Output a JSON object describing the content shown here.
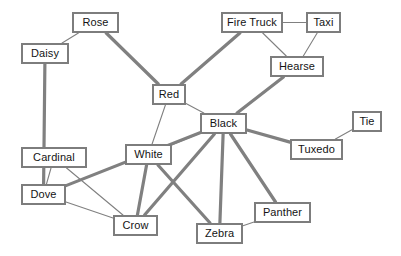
{
  "diagram": {
    "type": "node-link-graph",
    "background_color": "#ffffff",
    "node_border_color": "#7d7d7d",
    "node_fill_color": "#ffffff",
    "node_text_color": "#141414",
    "edge_color": "#808080",
    "edge_thick_width": 3.2,
    "edge_thin_width": 1.1,
    "nodes": [
      {
        "id": "rose",
        "label": "Rose",
        "x": 72,
        "y": 12,
        "w": 47,
        "h": 21
      },
      {
        "id": "fire_truck",
        "label": "Fire Truck",
        "x": 221,
        "y": 12,
        "w": 62,
        "h": 21
      },
      {
        "id": "taxi",
        "label": "Taxi",
        "x": 306,
        "y": 12,
        "w": 35,
        "h": 21
      },
      {
        "id": "daisy",
        "label": "Daisy",
        "x": 21,
        "y": 43,
        "w": 48,
        "h": 21
      },
      {
        "id": "hearse",
        "label": "Hearse",
        "x": 270,
        "y": 56,
        "w": 54,
        "h": 21
      },
      {
        "id": "red",
        "label": "Red",
        "x": 152,
        "y": 84,
        "w": 34,
        "h": 21
      },
      {
        "id": "black",
        "label": "Black",
        "x": 200,
        "y": 113,
        "w": 47,
        "h": 21
      },
      {
        "id": "tie",
        "label": "Tie",
        "x": 352,
        "y": 111,
        "w": 30,
        "h": 21
      },
      {
        "id": "white",
        "label": "White",
        "x": 125,
        "y": 144,
        "w": 47,
        "h": 21
      },
      {
        "id": "tuxedo",
        "label": "Tuxedo",
        "x": 290,
        "y": 139,
        "w": 53,
        "h": 21
      },
      {
        "id": "cardinal",
        "label": "Cardinal",
        "x": 21,
        "y": 147,
        "w": 66,
        "h": 21
      },
      {
        "id": "dove",
        "label": "Dove",
        "x": 21,
        "y": 184,
        "w": 45,
        "h": 21
      },
      {
        "id": "panther",
        "label": "Panther",
        "x": 254,
        "y": 202,
        "w": 57,
        "h": 21
      },
      {
        "id": "crow",
        "label": "Crow",
        "x": 113,
        "y": 215,
        "w": 45,
        "h": 21
      },
      {
        "id": "zebra",
        "label": "Zebra",
        "x": 196,
        "y": 223,
        "w": 47,
        "h": 21
      }
    ],
    "edges": [
      {
        "source": "daisy",
        "target": "rose",
        "weight": "thin"
      },
      {
        "source": "rose",
        "target": "red",
        "weight": "thick"
      },
      {
        "source": "daisy",
        "target": "dove",
        "weight": "thick"
      },
      {
        "source": "fire_truck",
        "target": "taxi",
        "weight": "thin"
      },
      {
        "source": "fire_truck",
        "target": "hearse",
        "weight": "thin"
      },
      {
        "source": "taxi",
        "target": "hearse",
        "weight": "thin"
      },
      {
        "source": "fire_truck",
        "target": "red",
        "weight": "thick"
      },
      {
        "source": "hearse",
        "target": "black",
        "weight": "thick"
      },
      {
        "source": "red",
        "target": "black",
        "weight": "thin"
      },
      {
        "source": "red",
        "target": "white",
        "weight": "thin"
      },
      {
        "source": "white",
        "target": "black",
        "weight": "thin"
      },
      {
        "source": "black",
        "target": "tuxedo",
        "weight": "thick"
      },
      {
        "source": "tuxedo",
        "target": "tie",
        "weight": "thin"
      },
      {
        "source": "black",
        "target": "panther",
        "weight": "thick"
      },
      {
        "source": "black",
        "target": "zebra",
        "weight": "thick"
      },
      {
        "source": "black",
        "target": "crow",
        "weight": "thick"
      },
      {
        "source": "black",
        "target": "dove",
        "weight": "thick"
      },
      {
        "source": "panther",
        "target": "zebra",
        "weight": "thin"
      },
      {
        "source": "white",
        "target": "zebra",
        "weight": "thick"
      },
      {
        "source": "white",
        "target": "crow",
        "weight": "thick"
      },
      {
        "source": "cardinal",
        "target": "dove",
        "weight": "thin"
      },
      {
        "source": "cardinal",
        "target": "crow",
        "weight": "thin"
      },
      {
        "source": "dove",
        "target": "crow",
        "weight": "thin"
      }
    ]
  }
}
